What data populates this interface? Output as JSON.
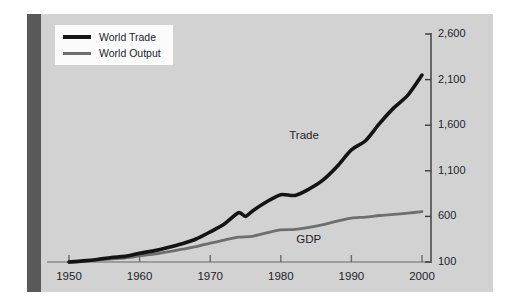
{
  "figure": {
    "background_color": "#d2d2d2",
    "left_bar_color": "#595959",
    "page_color": "#ffffff"
  },
  "legend": {
    "items": [
      {
        "label": "World Trade",
        "color": "#141414",
        "width": 4
      },
      {
        "label": "World Output",
        "color": "#6e6e6e",
        "width": 3
      }
    ]
  },
  "annotations": [
    {
      "text": "Trade",
      "x": 1988,
      "y": 1480
    },
    {
      "text": "GDP",
      "x": 1989,
      "y": 340
    }
  ],
  "chart_data": {
    "type": "line",
    "title": "",
    "subtitle": "",
    "xlabel": "",
    "ylabel": "",
    "xlim": [
      1948,
      2001
    ],
    "ylim": [
      100,
      2600
    ],
    "grid": false,
    "y_axis_position": "right",
    "x_ticks": [
      1950,
      1960,
      1970,
      1980,
      1990,
      2000
    ],
    "x_tick_labels": [
      "1950",
      "1960",
      "1970",
      "1980",
      "1990",
      "2000"
    ],
    "y_ticks": [
      100,
      600,
      1100,
      1600,
      2100,
      2600
    ],
    "y_tick_labels": [
      "100",
      "600",
      "1,100",
      "1,600",
      "2,100",
      "2,600"
    ],
    "legend_position": "top-left",
    "series": [
      {
        "name": "World Trade",
        "annotation": "Trade",
        "color": "#141414",
        "x": [
          1950,
          1952,
          1954,
          1956,
          1958,
          1960,
          1962,
          1964,
          1966,
          1968,
          1970,
          1972,
          1974,
          1975,
          1976,
          1978,
          1980,
          1982,
          1984,
          1986,
          1988,
          1990,
          1992,
          1994,
          1996,
          1998,
          2000
        ],
        "values": [
          100,
          112,
          128,
          150,
          162,
          196,
          222,
          258,
          300,
          352,
          430,
          516,
          640,
          600,
          660,
          760,
          838,
          830,
          900,
          1000,
          1150,
          1330,
          1430,
          1620,
          1790,
          1930,
          2150
        ]
      },
      {
        "name": "World Output",
        "annotation": "GDP",
        "color": "#6e6e6e",
        "x": [
          1950,
          1952,
          1954,
          1956,
          1958,
          1960,
          1962,
          1964,
          1966,
          1968,
          1970,
          1972,
          1974,
          1976,
          1978,
          1980,
          1982,
          1984,
          1986,
          1988,
          1990,
          1992,
          1994,
          1996,
          1998,
          2000
        ],
        "values": [
          100,
          110,
          120,
          134,
          146,
          166,
          186,
          212,
          240,
          268,
          308,
          340,
          372,
          382,
          420,
          452,
          458,
          480,
          510,
          548,
          582,
          592,
          610,
          622,
          636,
          652
        ]
      }
    ]
  }
}
